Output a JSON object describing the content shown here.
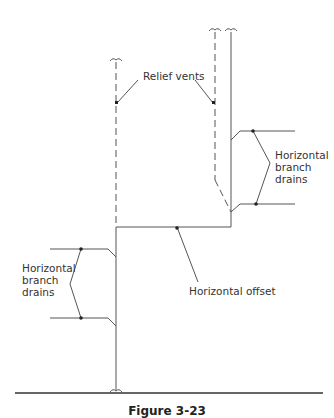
{
  "diagram": {
    "labels": {
      "relief_vents": "Relief vents",
      "horizontal_branch_drains_right": "Horizontal\nbranch\ndrains",
      "horizontal_branch_drains_left": "Horizontal\nbranch\ndrains",
      "horizontal_offset": "Horizontal offset"
    },
    "caption": "Figure 3-23",
    "colors": {
      "line": "#555555",
      "text": "#333333"
    }
  }
}
